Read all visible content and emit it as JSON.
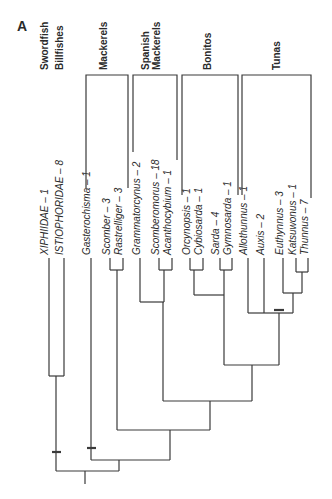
{
  "panel_label": "A",
  "groups": [
    {
      "label": "Swordfish",
      "x": 44,
      "y": 70
    },
    {
      "label": "Billfishes",
      "x": 59,
      "y": 70
    },
    {
      "label": "Mackerels",
      "x": 103,
      "y": 70
    },
    {
      "label": "Spanish",
      "x": 145,
      "y": 70
    },
    {
      "label": "Mackerels",
      "x": 156,
      "y": 70
    },
    {
      "label": "Bonitos",
      "x": 207,
      "y": 70
    },
    {
      "label": "Tunas",
      "x": 276,
      "y": 70
    }
  ],
  "taxa": [
    {
      "label": "XIPHIIDAE – 1",
      "x": 44,
      "bottom": 255
    },
    {
      "label": "ISTIOPHORIDAE – 8",
      "x": 59,
      "bottom": 255
    },
    {
      "label": "Gasterochisma – 1",
      "x": 86,
      "bottom": 255
    },
    {
      "label": "Scomber – 3",
      "x": 106,
      "bottom": 255
    },
    {
      "label": "Rastrelliger – 3",
      "x": 118,
      "bottom": 255
    },
    {
      "label": "Grammatorcynus – 2",
      "x": 136,
      "bottom": 255
    },
    {
      "label": "Scomberomorus – 18",
      "x": 155,
      "bottom": 255
    },
    {
      "label": "Acanthocybium – 1",
      "x": 167,
      "bottom": 255
    },
    {
      "label": "Orcynopsis – 1",
      "x": 186,
      "bottom": 255
    },
    {
      "label": "Cybiosarda – 1",
      "x": 198,
      "bottom": 255
    },
    {
      "label": "Sarda – 4",
      "x": 215,
      "bottom": 255
    },
    {
      "label": "Gymnosarda – 1",
      "x": 227,
      "bottom": 255
    },
    {
      "label": "Allothunnus – 1",
      "x": 243,
      "bottom": 255
    },
    {
      "label": "Auxis – 2",
      "x": 260,
      "bottom": 255
    },
    {
      "label": "Euthynnus – 3",
      "x": 279,
      "bottom": 255
    },
    {
      "label": "Katsuwonus – 1",
      "x": 292,
      "bottom": 255
    },
    {
      "label": "Thunnus – 7",
      "x": 304,
      "bottom": 255
    }
  ],
  "colors": {
    "line": "#3a3a3a",
    "text": "#2a2a2a",
    "background": "#ffffff"
  }
}
